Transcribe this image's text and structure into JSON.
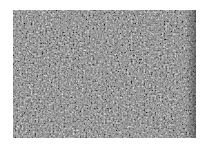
{
  "image": {
    "description": "Grayscale granular noise texture on white background",
    "background_color": "#ffffff",
    "texture_base_color": "#7a7a7a"
  }
}
